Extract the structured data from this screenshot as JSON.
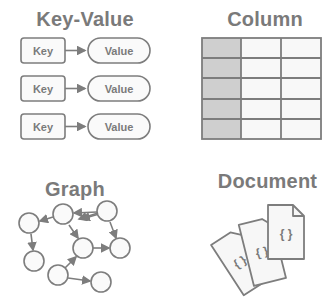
{
  "panels": {
    "key_value": {
      "title": "Key-Value",
      "rows": [
        {
          "key": "Key",
          "value": "Value"
        },
        {
          "key": "Key",
          "value": "Value"
        },
        {
          "key": "Key",
          "value": "Value"
        }
      ]
    },
    "column": {
      "title": "Column",
      "rows": 5,
      "cols": 3,
      "highlight_col": 0
    },
    "graph": {
      "title": "Graph"
    },
    "document": {
      "title": "Document",
      "doc_glyph": "{ }"
    }
  },
  "colors": {
    "stroke": "#7d7d7d",
    "fill_light": "#f7f7f7",
    "fill_dark": "#cfcfcf",
    "text": "#7a7a7a"
  }
}
